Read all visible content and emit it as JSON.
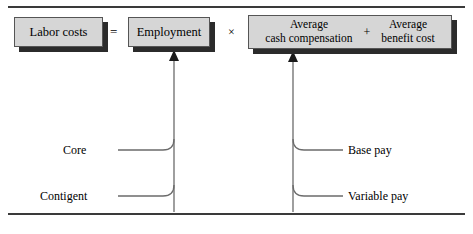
{
  "figure": {
    "rules": {
      "top": "",
      "bottom": ""
    },
    "boxes": {
      "labor_costs": "Labor costs",
      "employment": "Employment",
      "avg_cash_compensation": "Average\ncash compensation",
      "avg_benefit_cost": "Average\nbenefit cost"
    },
    "operators": {
      "equals": "=",
      "times": "×",
      "plus": "+"
    },
    "leaf_labels": {
      "core": "Core",
      "contigent": "Contigent",
      "base_pay": "Base pay",
      "variable_pay": "Variable pay"
    },
    "colors": {
      "box_fill": "#d6d6d6",
      "box_border": "#555555",
      "box_shadow": "#2b2b2b",
      "rule": "#3a3a3a",
      "connector": "#6b6b6b",
      "text": "#000000"
    }
  }
}
